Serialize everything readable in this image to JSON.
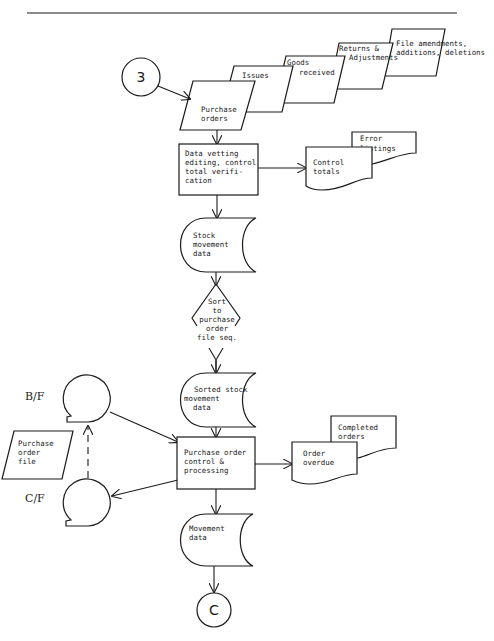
{
  "diagram": {
    "type": "systems flowchart",
    "connectors": {
      "entry": "3",
      "exit": "C"
    },
    "inputs": {
      "purchase_orders": [
        "Purchase",
        "orders"
      ],
      "issues": [
        "Issues"
      ],
      "goods_received": [
        "Goods",
        "received"
      ],
      "returns": [
        "Returns &",
        "Adjustments"
      ],
      "file_amendments": [
        "File amendments,",
        "additions, deletions"
      ]
    },
    "process_vetting": [
      "Data vetting",
      "editing, control",
      "total verifi-",
      "cation"
    ],
    "outputs_vetting": {
      "control_totals": [
        "Control",
        "totals"
      ],
      "error_listings": [
        "Error",
        "listings"
      ]
    },
    "stock_movement": [
      "Stock",
      "movement",
      "data"
    ],
    "sort": [
      "Sort",
      "to",
      "purchase",
      "order",
      "file seq."
    ],
    "sorted_stock": [
      "Sorted stock",
      "movement",
      "data"
    ],
    "tapes": {
      "bf": "B/F",
      "cf": "C/F"
    },
    "purchase_order_file": [
      "Purchase",
      "order",
      "file"
    ],
    "process_po": [
      "Purchase order",
      "control &",
      "processing"
    ],
    "outputs_po": {
      "order_overdue": [
        "Order",
        "overdue"
      ],
      "completed_orders": [
        "Completed",
        "orders"
      ]
    },
    "movement_data": [
      "Movement",
      "data"
    ]
  }
}
